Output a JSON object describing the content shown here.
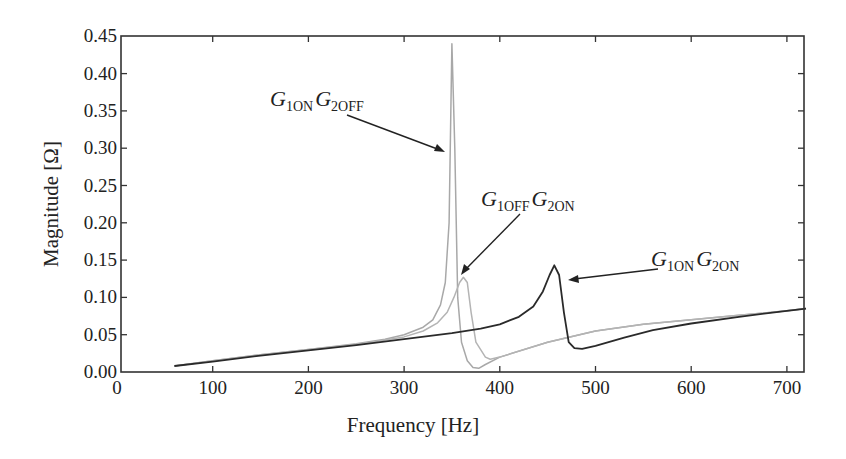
{
  "chart_data": {
    "type": "line",
    "title": "",
    "xlabel": "Frequency [Hz]",
    "ylabel": "Magnitude [Ω]",
    "xlim": [
      0,
      720
    ],
    "ylim": [
      0.0,
      0.45
    ],
    "x_ticks": [
      "0",
      "100",
      "200",
      "300",
      "400",
      "500",
      "600",
      "700"
    ],
    "y_ticks": [
      "0.00",
      "0.05",
      "0.10",
      "0.15",
      "0.20",
      "0.25",
      "0.30",
      "0.35",
      "0.40",
      "0.45"
    ],
    "grid": false,
    "legend": "annotations with arrows",
    "series": [
      {
        "name": "G1ON G2OFF",
        "color": "#a8a8a8",
        "x": [
          60,
          100,
          150,
          200,
          250,
          280,
          300,
          320,
          330,
          338,
          343,
          347,
          350,
          353,
          356,
          360,
          366,
          372,
          378,
          385,
          400,
          450,
          500,
          550,
          600,
          650,
          700,
          720
        ],
        "y": [
          0.008,
          0.015,
          0.023,
          0.03,
          0.038,
          0.044,
          0.05,
          0.06,
          0.07,
          0.09,
          0.12,
          0.2,
          0.44,
          0.3,
          0.1,
          0.04,
          0.015,
          0.006,
          0.005,
          0.01,
          0.02,
          0.04,
          0.055,
          0.064,
          0.07,
          0.076,
          0.082,
          0.085
        ]
      },
      {
        "name": "G1OFF G2ON",
        "color": "#b4b4b4",
        "x": [
          60,
          100,
          150,
          200,
          250,
          300,
          320,
          335,
          345,
          352,
          358,
          362,
          366,
          370,
          375,
          385,
          390,
          400,
          450,
          500,
          550,
          600,
          650,
          700,
          720
        ],
        "y": [
          0.008,
          0.015,
          0.023,
          0.03,
          0.037,
          0.047,
          0.055,
          0.066,
          0.08,
          0.1,
          0.12,
          0.127,
          0.12,
          0.08,
          0.04,
          0.02,
          0.017,
          0.02,
          0.04,
          0.055,
          0.064,
          0.07,
          0.076,
          0.082,
          0.085
        ]
      },
      {
        "name": "G1ON G2ON",
        "color": "#2a2a2a",
        "x": [
          60,
          100,
          150,
          200,
          250,
          300,
          350,
          380,
          400,
          420,
          435,
          445,
          452,
          457,
          462,
          467,
          472,
          478,
          486,
          500,
          530,
          560,
          600,
          650,
          700,
          720
        ],
        "y": [
          0.008,
          0.014,
          0.022,
          0.029,
          0.036,
          0.044,
          0.052,
          0.058,
          0.064,
          0.074,
          0.088,
          0.108,
          0.13,
          0.143,
          0.13,
          0.08,
          0.04,
          0.032,
          0.031,
          0.035,
          0.046,
          0.056,
          0.065,
          0.074,
          0.082,
          0.085
        ]
      }
    ],
    "annotations": [
      {
        "main1": "G",
        "sub1": "1ON",
        "main2": "G",
        "sub2": "2OFF",
        "points_to": "G1ON G2OFF peak"
      },
      {
        "main1": "G",
        "sub1": "1OFF",
        "main2": "G",
        "sub2": "2ON",
        "points_to": "G1OFF G2ON peak"
      },
      {
        "main1": "G",
        "sub1": "1ON",
        "main2": "G",
        "sub2": "2ON",
        "points_to": "G1ON G2ON peak"
      }
    ]
  }
}
